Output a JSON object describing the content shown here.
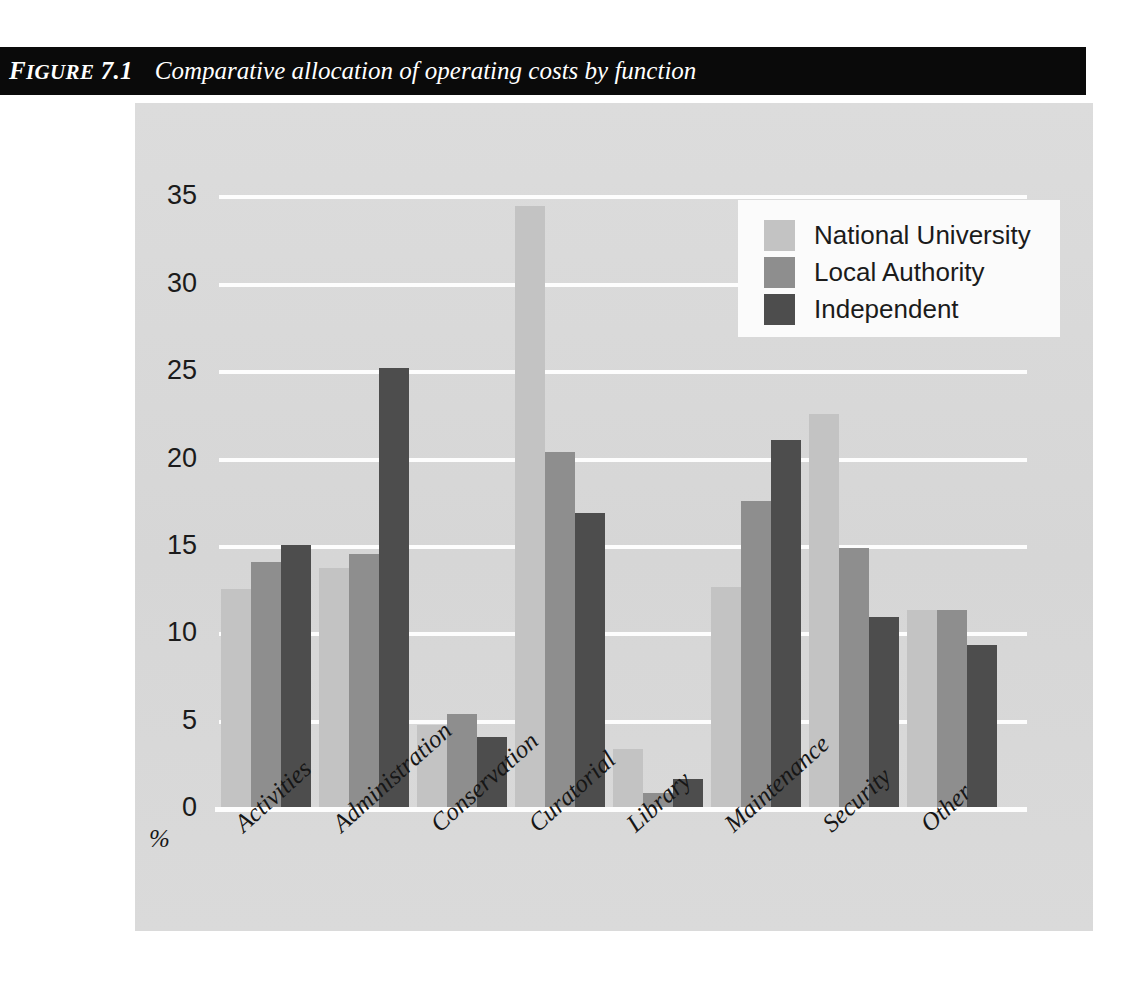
{
  "figure": {
    "label_prefix": "F",
    "label_caps": "IGURE",
    "label_number": "7.1",
    "title": "Comparative allocation of operating costs by function"
  },
  "legend": {
    "position": "top-right",
    "items": [
      {
        "label": "National University",
        "color": "#c3c3c3"
      },
      {
        "label": "Local Authority",
        "color": "#8e8e8e"
      },
      {
        "label": "Independent",
        "color": "#4d4d4d"
      }
    ]
  },
  "axis": {
    "y_ticks": [
      "0",
      "5",
      "10",
      "15",
      "20",
      "25",
      "30",
      "35"
    ],
    "y_unit_label": "%"
  },
  "colors": {
    "panel_background": "#d8d8d8",
    "gridline": "#fdfdfd",
    "banner_background": "#0a0a0a",
    "banner_text": "#ffffff",
    "tick_text": "#1b1b1b"
  },
  "chart_data": {
    "type": "bar",
    "title": "Comparative allocation of operating costs by function",
    "xlabel": "",
    "ylabel": "%",
    "ylim": [
      0,
      36
    ],
    "y_ticks": [
      0,
      5,
      10,
      15,
      20,
      25,
      30,
      35
    ],
    "grid": true,
    "legend_position": "top-right",
    "categories": [
      "Activities",
      "Administration",
      "Conservation",
      "Curatorial",
      "Library",
      "Maintenance",
      "Security",
      "Other"
    ],
    "series": [
      {
        "name": "National University",
        "color": "#c3c3c3",
        "values": [
          12.5,
          13.7,
          4.7,
          34.4,
          3.3,
          12.6,
          22.5,
          11.3
        ]
      },
      {
        "name": "Local Authority",
        "color": "#8e8e8e",
        "values": [
          14.0,
          14.5,
          5.3,
          20.3,
          0.8,
          17.5,
          14.8,
          11.3
        ]
      },
      {
        "name": "Independent",
        "color": "#4d4d4d",
        "values": [
          15.0,
          25.1,
          4.0,
          16.8,
          1.6,
          21.0,
          10.9,
          9.3
        ]
      }
    ]
  }
}
